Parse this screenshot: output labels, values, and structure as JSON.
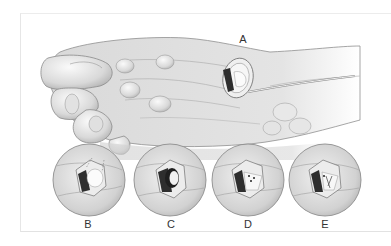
{
  "figure": {
    "main_label": "A",
    "inset_labels": [
      "B",
      "C",
      "D",
      "E"
    ],
    "colors": {
      "skin_light": "#f2f2f2",
      "skin_mid": "#d6d6d6",
      "skin_shadow": "#a8a8a8",
      "outline": "#8a8a8a",
      "dark_tissue": "#2e2e2e",
      "label": "#333333",
      "frame_border": "#e6e6e6"
    }
  }
}
